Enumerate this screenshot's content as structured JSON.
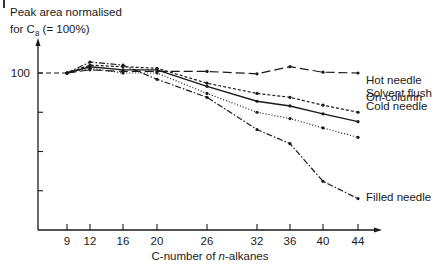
{
  "chart_data": {
    "type": "line",
    "title": "",
    "ylabel_line1": "Peak area normalised",
    "ylabel_line2_prefix": "for C",
    "ylabel_line2_sub": "8",
    "ylabel_line2_suffix": " (= 100%)",
    "xlabel_prefix": "C-number of ",
    "xlabel_italic": "n",
    "xlabel_suffix": "-alkanes",
    "x": [
      9,
      12,
      16,
      20,
      26,
      32,
      36,
      40,
      44
    ],
    "x_tick_labels": [
      "9",
      "12",
      "16",
      "20",
      "26",
      "32",
      "36",
      "40",
      "44"
    ],
    "y_ticks": [
      25,
      50,
      75,
      100
    ],
    "y_tick_labels_visible": [
      "100"
    ],
    "ylim": [
      0,
      115
    ],
    "grid": false,
    "legend_position": "inline-right",
    "series": [
      {
        "name": "On-column",
        "style": "long-dash",
        "values": [
          100,
          102,
          101,
          101,
          101,
          99.5,
          104,
          100.5,
          100
        ]
      },
      {
        "name": "Hot needle",
        "style": "short-dash",
        "values": [
          100,
          105,
          104,
          103,
          93.5,
          87,
          84.5,
          79.5,
          75
        ]
      },
      {
        "name": "Solvent flush",
        "style": "solid",
        "values": [
          100,
          104,
          102,
          102,
          91.5,
          82,
          79,
          74,
          69
        ]
      },
      {
        "name": "Cold needle",
        "style": "dotted",
        "values": [
          100,
          103,
          100,
          100,
          87,
          75,
          71,
          65,
          59
        ]
      },
      {
        "name": "Filled needle",
        "style": "dash-dot",
        "values": [
          100,
          107,
          105,
          96,
          84.5,
          64,
          55,
          31,
          20
        ]
      }
    ]
  }
}
